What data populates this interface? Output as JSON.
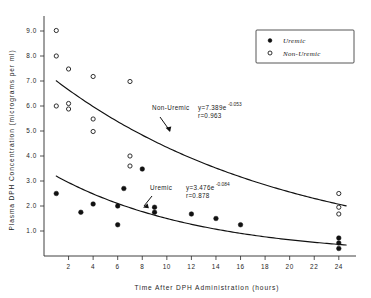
{
  "chart_data": {
    "type": "scatter",
    "title": "",
    "xlabel": "Time After DPH Administration (hours)",
    "ylabel": "Plasma DPH Concentration (micrograms per ml)",
    "xlim": [
      0,
      25.4
    ],
    "ylim": [
      0,
      9.6
    ],
    "grid": false,
    "xticks": [
      2,
      4,
      6,
      8,
      10,
      12,
      14,
      16,
      18,
      20,
      22,
      24
    ],
    "xticklabels": [
      "2",
      "4",
      "6",
      "8",
      "10",
      "12",
      "14",
      "16",
      "18",
      "20",
      "22",
      "24"
    ],
    "yticks": [
      1.0,
      2.0,
      3.0,
      4.0,
      5.0,
      6.0,
      7.0,
      8.0,
      9.0
    ],
    "yticklabels": [
      "1.0",
      "2.0",
      "3.0",
      "4.0",
      "5.0",
      "6.0",
      "7.0",
      "8.0",
      "9.0"
    ],
    "legend_position": "top-right",
    "series": [
      {
        "name": "Uremic",
        "marker": "filled-circle",
        "color": "#111111",
        "points": [
          {
            "x": 1,
            "y": 2.5
          },
          {
            "x": 3,
            "y": 1.75
          },
          {
            "x": 4,
            "y": 2.08
          },
          {
            "x": 6,
            "y": 2.0
          },
          {
            "x": 6,
            "y": 1.25
          },
          {
            "x": 6.5,
            "y": 2.7
          },
          {
            "x": 8,
            "y": 3.48
          },
          {
            "x": 9,
            "y": 1.95
          },
          {
            "x": 9,
            "y": 1.75
          },
          {
            "x": 12,
            "y": 1.68
          },
          {
            "x": 14,
            "y": 1.5
          },
          {
            "x": 16,
            "y": 1.25
          },
          {
            "x": 24,
            "y": 0.72
          },
          {
            "x": 24,
            "y": 0.52
          },
          {
            "x": 24,
            "y": 0.3
          }
        ]
      },
      {
        "name": "Non-Uremic",
        "marker": "open-circle",
        "color": "#1a1a1a",
        "points": [
          {
            "x": 1,
            "y": 9.02
          },
          {
            "x": 1,
            "y": 8.0
          },
          {
            "x": 2,
            "y": 7.48
          },
          {
            "x": 4,
            "y": 7.18
          },
          {
            "x": 7,
            "y": 6.98
          },
          {
            "x": 1,
            "y": 6.0
          },
          {
            "x": 2,
            "y": 6.1
          },
          {
            "x": 2,
            "y": 5.88
          },
          {
            "x": 4,
            "y": 5.48
          },
          {
            "x": 4,
            "y": 4.98
          },
          {
            "x": 7,
            "y": 4.0
          },
          {
            "x": 7,
            "y": 3.6
          },
          {
            "x": 24,
            "y": 2.5
          },
          {
            "x": 24,
            "y": 1.95
          },
          {
            "x": 24,
            "y": 1.68
          }
        ]
      }
    ],
    "fit_curves": [
      {
        "name": "Non-Uremic",
        "intercept": 7.389,
        "rate": -0.053,
        "x_start": 1.0,
        "x_end": 24.6
      },
      {
        "name": "Uremic",
        "intercept": 3.476,
        "rate": -0.084,
        "x_start": 1.0,
        "x_end": 24.6
      }
    ]
  },
  "legend": {
    "items": [
      {
        "label": "Uremic",
        "marker": "filled-circle"
      },
      {
        "label": "Non-Uremic",
        "marker": "open-circle"
      }
    ]
  },
  "annotations": {
    "non_uremic": {
      "label": "Non-Uremic",
      "equation_base": "y=7.389e",
      "equation_exponent": "-0.053",
      "correlation": "r=0.963"
    },
    "uremic": {
      "label": "Uremic",
      "equation_base": "y=3.476e",
      "equation_exponent": "-0.084",
      "correlation": "r=0.878"
    }
  }
}
